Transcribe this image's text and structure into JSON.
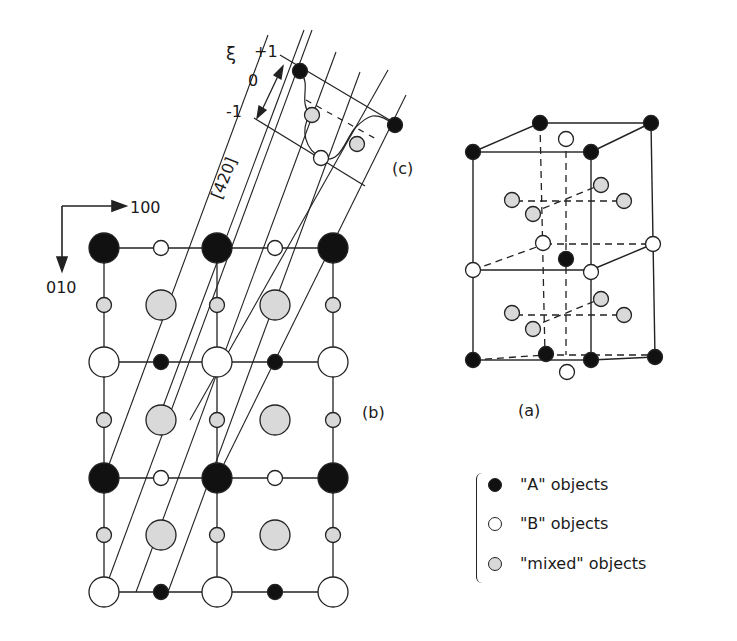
{
  "figure": {
    "panel_labels": {
      "a": "(a)",
      "b": "(b)",
      "c": "(c)"
    },
    "axes": {
      "x_dir": "100",
      "y_dir": "010"
    },
    "direction_label": "[420]",
    "xi": {
      "symbol": "ξ",
      "plus": "+1",
      "zero": "0",
      "minus": "-1"
    }
  },
  "legend": {
    "items": [
      {
        "label": "\"A\" objects",
        "fill": "#111111"
      },
      {
        "label": "\"B\" objects",
        "fill": "#ffffff"
      },
      {
        "label": "\"mixed\" objects",
        "fill": "#d9d9d9"
      }
    ]
  },
  "colors": {
    "A": "#111111",
    "B": "#ffffff",
    "mixed": "#d9d9d9",
    "line": "#222222"
  }
}
